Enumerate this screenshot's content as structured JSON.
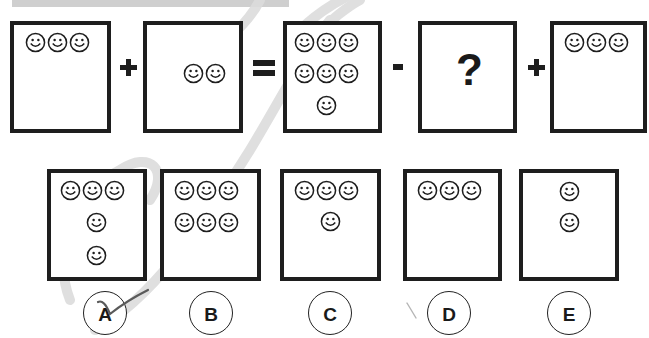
{
  "puzzle": {
    "equation_row": [
      {
        "id": "box1",
        "smiley_count": 3,
        "layout": "row-of-3"
      },
      {
        "id": "op1",
        "symbol": "+"
      },
      {
        "id": "box2",
        "smiley_count": 2,
        "layout": "pair-middle"
      },
      {
        "id": "op2",
        "symbol": "="
      },
      {
        "id": "box3",
        "smiley_count": 7,
        "layout": "3-3-1"
      },
      {
        "id": "op3",
        "symbol": "-"
      },
      {
        "id": "box4",
        "symbol": "?"
      },
      {
        "id": "op4",
        "symbol": "+"
      },
      {
        "id": "box5",
        "smiley_count": 3,
        "layout": "row-of-3"
      }
    ],
    "unknown_label": "?",
    "options": [
      {
        "label": "A",
        "smiley_count": 5,
        "layout": "3-1-1",
        "marked": true
      },
      {
        "label": "B",
        "smiley_count": 6,
        "layout": "3-3"
      },
      {
        "label": "C",
        "smiley_count": 4,
        "layout": "3-1"
      },
      {
        "label": "D",
        "smiley_count": 3,
        "layout": "3"
      },
      {
        "label": "E",
        "smiley_count": 2,
        "layout": "1-1"
      }
    ]
  },
  "colors": {
    "ink": "#1e1e1e",
    "banner": "#cfcfcf",
    "watermark": "#d9d9d9",
    "check": "#555555"
  }
}
